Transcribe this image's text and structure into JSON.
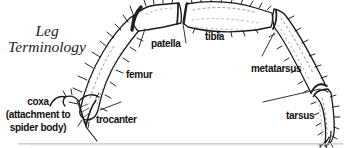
{
  "title": {
    "line1": "Leg",
    "line2": "Terminology"
  },
  "labels": {
    "coxa": {
      "line1": "coxa",
      "line2": "(attachment to",
      "line3": "spider body)"
    },
    "trocanter": "trocanter",
    "femur": "femur",
    "patella": "patella",
    "tibia": "tibia",
    "metatarsus": "metatarsus",
    "tarsus": "tarsus"
  },
  "colors": {
    "ink": "#1a1a1a",
    "background": "#ffffff",
    "shadow": "#c2c2c2"
  }
}
